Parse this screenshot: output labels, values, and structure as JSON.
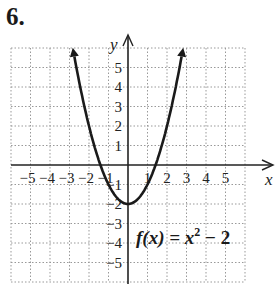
{
  "problem_number": "6.",
  "chart_data": {
    "type": "line",
    "title": "",
    "function_label": "f(x) = x^2 - 2",
    "function_label_parts": {
      "lhs": "f(x) = x",
      "exp": "2",
      "rhs": " − 2"
    },
    "xlabel": "x",
    "ylabel": "y",
    "xlim": [
      -6,
      6
    ],
    "ylim": [
      -6,
      6
    ],
    "grid": true,
    "x_tick_labels": [
      "−5",
      "−4",
      "−3",
      "−2",
      "−1",
      "1",
      "2",
      "3",
      "4",
      "5"
    ],
    "y_tick_labels": [
      "5",
      "4",
      "3",
      "2",
      "1",
      "−1",
      "−2",
      "−3",
      "−4",
      "−5"
    ],
    "series": [
      {
        "name": "f(x) = x^2 - 2",
        "x": [
          -2.8,
          -2.5,
          -2,
          -1.5,
          -1,
          -0.5,
          0,
          0.5,
          1,
          1.5,
          2,
          2.5,
          2.8
        ],
        "y": [
          5.84,
          4.25,
          2,
          0.25,
          -1,
          -1.75,
          -2,
          -1.75,
          -1,
          0.25,
          2,
          4.25,
          5.84
        ]
      }
    ],
    "key_points": {
      "vertex": [
        0,
        -2
      ],
      "x_intercepts": [
        -1.414,
        1.414
      ]
    }
  }
}
